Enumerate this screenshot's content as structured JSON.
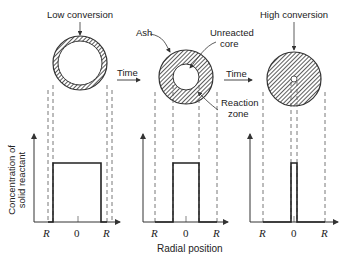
{
  "diagram": {
    "stages": [
      {
        "label": "Low conversion",
        "core_radius_fraction": 0.82,
        "ticks": [
          "R",
          "0",
          "R"
        ]
      },
      {
        "label": "",
        "core_radius_fraction": 0.48,
        "ticks": [
          "R",
          "0",
          "R"
        ]
      },
      {
        "label": "High conversion",
        "core_radius_fraction": 0.1,
        "ticks": [
          "R",
          "0",
          "R"
        ]
      }
    ],
    "annotations": {
      "ash": "Ash",
      "unreacted_core_line1": "Unreacted",
      "unreacted_core_line2": "core",
      "reaction_zone_line1": "Reaction",
      "reaction_zone_line2": "zone"
    },
    "time_label": "Time",
    "y_axis_label_line1": "Concentration of",
    "y_axis_label_line2": "solid reactant",
    "x_axis_label": "Radial position"
  }
}
